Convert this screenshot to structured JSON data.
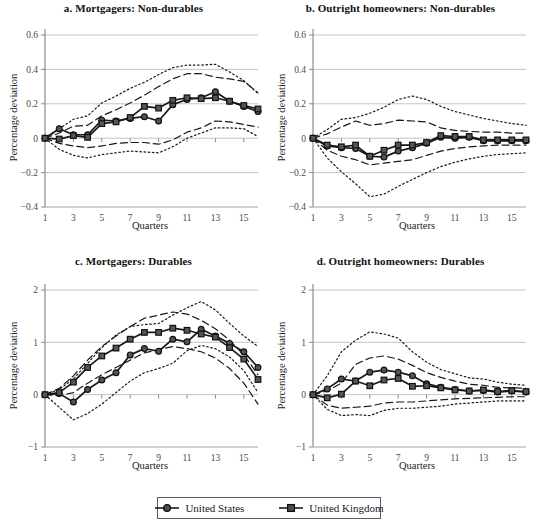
{
  "figure": {
    "width": 534,
    "height": 529,
    "background": "#ffffff",
    "line_color": "#1a1a1a",
    "grid_color": "#bdbdbd",
    "axis_color": "#8a8a8a"
  },
  "legend": {
    "position": "bottom-center",
    "entries": [
      {
        "label": "United States",
        "marker": "circle-marker",
        "style": "solid"
      },
      {
        "label": "United Kingdom",
        "marker": "square-marker",
        "style": "solid"
      }
    ]
  },
  "axis_titles": {
    "x": "Quarters",
    "y": "Percentage deviation"
  },
  "chart_data": [
    {
      "id": "panel-a",
      "type": "line",
      "title": "a. Mortgagers: Non-durables",
      "xlabel": "Quarters",
      "ylabel": "Percentage deviation",
      "x": [
        1,
        2,
        3,
        4,
        5,
        6,
        7,
        8,
        9,
        10,
        11,
        12,
        13,
        14,
        15,
        16
      ],
      "xlim": [
        1,
        16
      ],
      "ylim": [
        -0.4,
        0.6
      ],
      "yticks": [
        -0.4,
        -0.2,
        0,
        0.2,
        0.4,
        0.6
      ],
      "ytick_labels": [
        "−0.4",
        "−0.2",
        "0",
        "0.2",
        "0.4",
        "0.6"
      ],
      "xticks": [
        1,
        3,
        5,
        7,
        9,
        11,
        13,
        15
      ],
      "xtick_labels": [
        "1",
        "3",
        "5",
        "7",
        "9",
        "11",
        "13",
        "15"
      ],
      "grid": true,
      "legend_position": "figure-bottom",
      "series": [
        {
          "name": "United States",
          "marker": "circle",
          "style": "solid",
          "values": [
            0.0,
            0.055,
            0.02,
            0.02,
            0.105,
            0.1,
            0.115,
            0.125,
            0.1,
            0.195,
            0.225,
            0.235,
            0.27,
            0.215,
            0.185,
            0.155
          ]
        },
        {
          "name": "United Kingdom",
          "marker": "square",
          "style": "solid",
          "values": [
            0.0,
            -0.005,
            0.015,
            0.005,
            0.085,
            0.095,
            0.12,
            0.185,
            0.175,
            0.22,
            0.235,
            0.23,
            0.235,
            0.215,
            0.19,
            0.17
          ]
        },
        {
          "name": "Inner band upper",
          "marker": "none",
          "style": "dashed",
          "values": [
            0.0,
            0.03,
            0.07,
            0.075,
            0.13,
            0.165,
            0.205,
            0.25,
            0.3,
            0.345,
            0.375,
            0.375,
            0.355,
            0.345,
            0.33,
            0.265
          ]
        },
        {
          "name": "Inner band lower",
          "marker": "none",
          "style": "dashed",
          "values": [
            0.0,
            -0.03,
            -0.045,
            -0.055,
            -0.045,
            -0.03,
            -0.025,
            -0.025,
            -0.035,
            -0.01,
            0.035,
            0.06,
            0.1,
            0.095,
            0.08,
            0.065
          ]
        },
        {
          "name": "Outer band upper",
          "marker": "none",
          "style": "dotted",
          "values": [
            0.0,
            0.055,
            0.11,
            0.13,
            0.205,
            0.245,
            0.29,
            0.325,
            0.37,
            0.41,
            0.425,
            0.425,
            0.43,
            0.385,
            0.335,
            0.26
          ]
        },
        {
          "name": "Outer band lower",
          "marker": "none",
          "style": "dotted",
          "values": [
            0.0,
            -0.065,
            -0.1,
            -0.115,
            -0.095,
            -0.085,
            -0.075,
            -0.08,
            -0.085,
            -0.05,
            0.0,
            0.03,
            0.06,
            0.06,
            0.055,
            0.01
          ]
        }
      ]
    },
    {
      "id": "panel-b",
      "type": "line",
      "title": "b. Outright homeowners: Non-durables",
      "xlabel": "Quarters",
      "ylabel": "Percentage deviation",
      "x": [
        1,
        2,
        3,
        4,
        5,
        6,
        7,
        8,
        9,
        10,
        11,
        12,
        13,
        14,
        15,
        16
      ],
      "xlim": [
        1,
        16
      ],
      "ylim": [
        -0.4,
        0.6
      ],
      "yticks": [
        -0.4,
        -0.2,
        0,
        0.2,
        0.4,
        0.6
      ],
      "ytick_labels": [
        "−0.4",
        "−0.2",
        "0",
        "0.2",
        "0.4",
        "0.6"
      ],
      "xticks": [
        1,
        3,
        5,
        7,
        9,
        11,
        13,
        15
      ],
      "xtick_labels": [
        "1",
        "3",
        "5",
        "7",
        "9",
        "11",
        "13",
        "15"
      ],
      "grid": true,
      "legend_position": "figure-bottom",
      "series": [
        {
          "name": "United States",
          "marker": "circle",
          "style": "solid",
          "values": [
            0.0,
            -0.045,
            -0.055,
            -0.06,
            -0.105,
            -0.11,
            -0.075,
            -0.055,
            -0.03,
            0.005,
            0.0,
            0.005,
            -0.015,
            -0.015,
            -0.015,
            -0.015
          ]
        },
        {
          "name": "United Kingdom",
          "marker": "square",
          "style": "solid",
          "values": [
            0.0,
            -0.04,
            -0.05,
            -0.04,
            -0.105,
            -0.07,
            -0.04,
            -0.04,
            -0.025,
            0.015,
            0.01,
            0.01,
            -0.01,
            -0.01,
            -0.01,
            -0.01
          ]
        },
        {
          "name": "Inner band upper",
          "marker": "none",
          "style": "dashed",
          "values": [
            0.0,
            0.025,
            0.065,
            0.1,
            0.075,
            0.085,
            0.105,
            0.1,
            0.095,
            0.06,
            0.045,
            0.04,
            0.035,
            0.035,
            0.03,
            0.03
          ]
        },
        {
          "name": "Inner band lower",
          "marker": "none",
          "style": "dashed",
          "values": [
            0.0,
            -0.07,
            -0.105,
            -0.125,
            -0.155,
            -0.145,
            -0.135,
            -0.125,
            -0.1,
            -0.075,
            -0.06,
            -0.05,
            -0.045,
            -0.04,
            -0.04,
            -0.04
          ]
        },
        {
          "name": "Outer band upper",
          "marker": "none",
          "style": "dotted",
          "values": [
            0.0,
            0.05,
            0.11,
            0.12,
            0.145,
            0.18,
            0.225,
            0.245,
            0.225,
            0.185,
            0.155,
            0.135,
            0.115,
            0.1,
            0.085,
            0.075
          ]
        },
        {
          "name": "Outer band lower",
          "marker": "none",
          "style": "dotted",
          "values": [
            0.0,
            -0.115,
            -0.195,
            -0.265,
            -0.34,
            -0.325,
            -0.28,
            -0.24,
            -0.2,
            -0.165,
            -0.14,
            -0.12,
            -0.105,
            -0.095,
            -0.09,
            -0.085
          ]
        }
      ]
    },
    {
      "id": "panel-c",
      "type": "line",
      "title": "c. Mortgagers: Durables",
      "xlabel": "Quarters",
      "ylabel": "Percentage deviation",
      "x": [
        1,
        2,
        3,
        4,
        5,
        6,
        7,
        8,
        9,
        10,
        11,
        12,
        13,
        14,
        15,
        16
      ],
      "xlim": [
        1,
        16
      ],
      "ylim": [
        -1,
        2
      ],
      "yticks": [
        -1,
        0,
        1,
        2
      ],
      "ytick_labels": [
        "−1",
        "0",
        "1",
        "2"
      ],
      "xticks": [
        1,
        3,
        5,
        7,
        9,
        11,
        13,
        15
      ],
      "xtick_labels": [
        "1",
        "3",
        "5",
        "7",
        "9",
        "11",
        "13",
        "15"
      ],
      "grid": true,
      "legend_position": "figure-bottom",
      "series": [
        {
          "name": "United States",
          "marker": "circle",
          "style": "solid",
          "values": [
            0.0,
            0.02,
            -0.14,
            0.1,
            0.28,
            0.42,
            0.76,
            0.88,
            0.83,
            1.06,
            1.01,
            1.25,
            1.12,
            0.98,
            0.82,
            0.52
          ]
        },
        {
          "name": "United Kingdom",
          "marker": "square",
          "style": "solid",
          "values": [
            0.0,
            0.04,
            0.24,
            0.52,
            0.74,
            0.89,
            1.06,
            1.19,
            1.19,
            1.27,
            1.23,
            1.16,
            1.1,
            0.9,
            0.68,
            0.29
          ]
        },
        {
          "name": "Inner band upper",
          "marker": "none",
          "style": "dashed",
          "values": [
            0.0,
            0.12,
            0.36,
            0.66,
            0.92,
            1.12,
            1.3,
            1.46,
            1.52,
            1.58,
            1.54,
            1.42,
            1.26,
            1.04,
            0.76,
            0.38
          ]
        },
        {
          "name": "Inner band lower",
          "marker": "none",
          "style": "dashed",
          "values": [
            0.0,
            -0.02,
            0.04,
            0.22,
            0.38,
            0.52,
            0.66,
            0.8,
            0.86,
            0.92,
            0.88,
            0.82,
            0.7,
            0.5,
            0.22,
            -0.18
          ]
        },
        {
          "name": "Outer band upper",
          "marker": "none",
          "style": "dotted",
          "values": [
            0.0,
            0.1,
            0.3,
            0.6,
            0.9,
            1.14,
            1.3,
            1.34,
            1.36,
            1.52,
            1.66,
            1.78,
            1.62,
            1.36,
            1.12,
            0.92
          ]
        },
        {
          "name": "Outer band lower",
          "marker": "none",
          "style": "dotted",
          "values": [
            0.0,
            -0.24,
            -0.48,
            -0.36,
            -0.18,
            0.04,
            0.26,
            0.42,
            0.5,
            0.6,
            0.84,
            0.94,
            0.88,
            0.72,
            0.46,
            0.04
          ]
        }
      ]
    },
    {
      "id": "panel-d",
      "type": "line",
      "title": "d. Outright homeowners: Durables",
      "xlabel": "Quarters",
      "ylabel": "Percentage deviation",
      "x": [
        1,
        2,
        3,
        4,
        5,
        6,
        7,
        8,
        9,
        10,
        11,
        12,
        13,
        14,
        15,
        16
      ],
      "xlim": [
        1,
        16
      ],
      "ylim": [
        -1,
        2
      ],
      "yticks": [
        -1,
        0,
        1,
        2
      ],
      "ytick_labels": [
        "−1",
        "0",
        "1",
        "2"
      ],
      "xticks": [
        1,
        3,
        5,
        7,
        9,
        11,
        13,
        15
      ],
      "xtick_labels": [
        "1",
        "3",
        "5",
        "7",
        "9",
        "11",
        "13",
        "15"
      ],
      "grid": true,
      "legend_position": "figure-bottom",
      "series": [
        {
          "name": "United States",
          "marker": "circle",
          "style": "solid",
          "values": [
            0.0,
            0.11,
            0.3,
            0.26,
            0.43,
            0.47,
            0.43,
            0.36,
            0.21,
            0.14,
            0.1,
            0.07,
            0.08,
            0.05,
            0.07,
            0.05
          ]
        },
        {
          "name": "United Kingdom",
          "marker": "square",
          "style": "solid",
          "values": [
            0.0,
            -0.06,
            0.01,
            0.26,
            0.17,
            0.28,
            0.31,
            0.16,
            0.17,
            0.13,
            0.09,
            0.07,
            0.09,
            0.06,
            0.08,
            0.06
          ]
        },
        {
          "name": "Inner band upper",
          "marker": "none",
          "style": "dashed",
          "values": [
            0.0,
            0.07,
            0.22,
            0.58,
            0.7,
            0.74,
            0.68,
            0.56,
            0.42,
            0.33,
            0.26,
            0.2,
            0.18,
            0.14,
            0.13,
            0.12
          ]
        },
        {
          "name": "Inner band lower",
          "marker": "none",
          "style": "dashed",
          "values": [
            0.0,
            -0.2,
            -0.26,
            -0.24,
            -0.22,
            -0.16,
            -0.14,
            -0.14,
            -0.12,
            -0.1,
            -0.08,
            -0.07,
            -0.06,
            -0.05,
            -0.04,
            -0.04
          ]
        },
        {
          "name": "Outer band upper",
          "marker": "none",
          "style": "dotted",
          "values": [
            0.0,
            0.36,
            0.82,
            1.04,
            1.2,
            1.16,
            1.08,
            0.82,
            0.62,
            0.48,
            0.4,
            0.32,
            0.3,
            0.24,
            0.2,
            0.18
          ]
        },
        {
          "name": "Outer band lower",
          "marker": "none",
          "style": "dotted",
          "values": [
            0.0,
            -0.28,
            -0.4,
            -0.38,
            -0.4,
            -0.3,
            -0.26,
            -0.26,
            -0.24,
            -0.22,
            -0.18,
            -0.16,
            -0.14,
            -0.12,
            -0.12,
            -0.12
          ]
        }
      ]
    }
  ]
}
